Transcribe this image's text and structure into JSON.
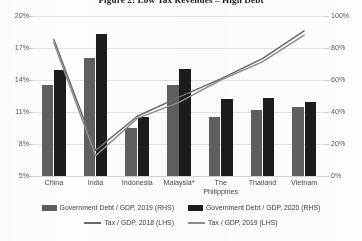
{
  "title": "Figure 2: Low Tax Revenues – High Debt",
  "axes": {
    "left_ticks": [
      "20%",
      "17%",
      "14%",
      "11%",
      "8%",
      "5%"
    ],
    "right_ticks": [
      "100%",
      "80%",
      "60%",
      "40%",
      "20%",
      "0%"
    ]
  },
  "legend": {
    "row1": [
      {
        "label": "Government Debt / GDP, 2019 (RHS)",
        "color": "#5f5f5f",
        "kind": "bar"
      },
      {
        "label": "Government Debt / GDP, 2020 (RHS)",
        "color": "#1c1c1c",
        "kind": "bar"
      }
    ],
    "row2": [
      {
        "label": "Tax / GDP,  2018 (LHS)",
        "color": "#6b6b6b",
        "kind": "line"
      },
      {
        "label": "Tax / GDP,  2019 (LHS)",
        "color": "#8e8e8e",
        "kind": "line"
      }
    ]
  },
  "chart_data": {
    "type": "bar",
    "title": "Figure 2: Low Tax Revenues – High Debt",
    "xlabel": "",
    "ylabel": "",
    "grid": true,
    "legend_position": "bottom",
    "categories": [
      "China",
      "India",
      "Indonesia",
      "Malaysia*",
      "The Philippines",
      "Thailand",
      "Vietnam"
    ],
    "category_lines": [
      [
        "China"
      ],
      [
        "India"
      ],
      [
        "Indonesia"
      ],
      [
        "Malaysia*"
      ],
      [
        "The",
        "Philippines"
      ],
      [
        "Thailand"
      ],
      [
        "Vietnam"
      ]
    ],
    "left_axis": {
      "label": "Tax / GDP (LHS)",
      "min": 5,
      "max": 20,
      "ticks": [
        5,
        8,
        11,
        14,
        17,
        20
      ],
      "unit": "%"
    },
    "right_axis": {
      "label": "Government Debt / GDP (RHS)",
      "min": 0,
      "max": 100,
      "ticks": [
        0,
        20,
        40,
        60,
        80,
        100
      ],
      "unit": "%"
    },
    "series": [
      {
        "name": "Government Debt / GDP, 2019 (RHS)",
        "kind": "bar",
        "axis": "right",
        "color": "#5f5f5f",
        "values": [
          57,
          74,
          30,
          57,
          37,
          41,
          43
        ]
      },
      {
        "name": "Government Debt / GDP, 2020 (RHS)",
        "kind": "bar",
        "axis": "right",
        "color": "#1c1c1c",
        "values": [
          66,
          89,
          37,
          67,
          48,
          49,
          46
        ]
      },
      {
        "name": "Tax / GDP,  2018 (LHS)",
        "kind": "line",
        "axis": "left",
        "color": "#6b6b6b",
        "values": [
          17.8,
          7.4,
          10.6,
          12.4,
          14.1,
          16.0,
          18.6
        ]
      },
      {
        "name": "Tax / GDP,  2019 (LHS)",
        "kind": "line",
        "axis": "left",
        "color": "#8e8e8e",
        "values": [
          17.5,
          6.9,
          10.4,
          11.9,
          14.0,
          15.7,
          18.2
        ]
      }
    ]
  }
}
